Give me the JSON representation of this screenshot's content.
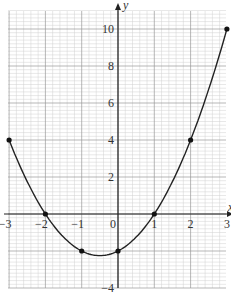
{
  "chart_data": {
    "type": "line",
    "title": "",
    "xlabel": "x",
    "ylabel": "y",
    "xlim": [
      -3,
      3
    ],
    "ylim": [
      -4,
      11
    ],
    "grid": true,
    "x_ticks": [
      "-3",
      "-2",
      "-1",
      "0",
      "1",
      "2",
      "3"
    ],
    "y_ticks": [
      "-4",
      "2",
      "4",
      "6",
      "8",
      "10"
    ],
    "series": [
      {
        "name": "y = x^2 + x - 2",
        "x": [
          -3,
          -2,
          -1,
          0,
          1,
          2,
          3
        ],
        "values": [
          4,
          0,
          -2,
          -2,
          0,
          4,
          10
        ],
        "marker": "dot",
        "curve": "smooth parabola"
      }
    ],
    "colors": {
      "line": "#222222",
      "grid_major": "#9a9a9a",
      "grid_minor": "#d0d0d0",
      "axis": "#222222"
    }
  }
}
